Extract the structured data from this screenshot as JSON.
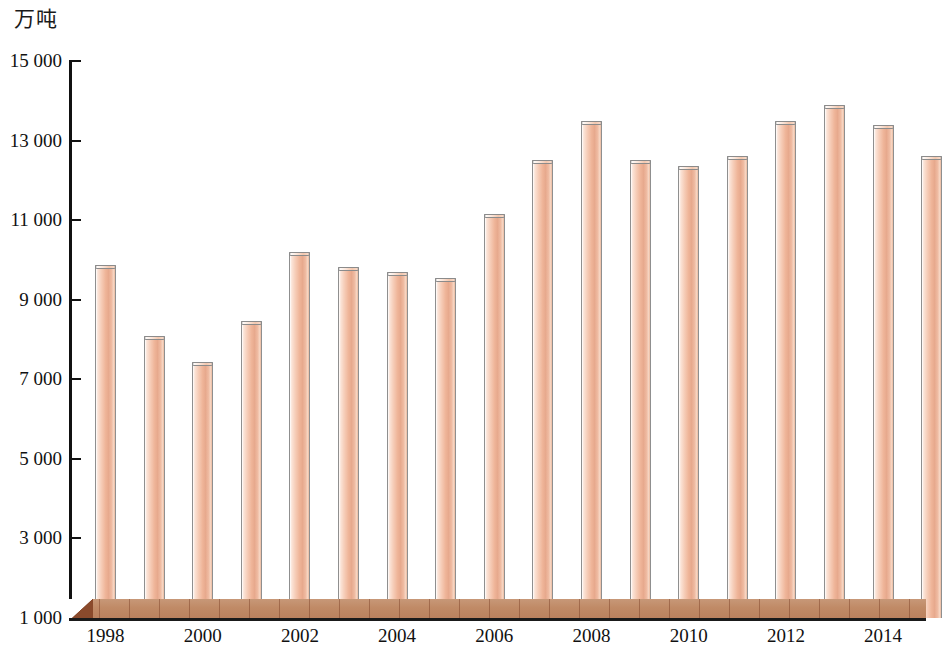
{
  "unit_label": "万吨",
  "chart_data": {
    "type": "bar",
    "title": "",
    "subtitle": "",
    "xlabel": "",
    "ylabel": "万吨",
    "ylim": [
      1000,
      15000
    ],
    "ytick_step": 2000,
    "grid": false,
    "legend": null,
    "categories": [
      "1998",
      "1999",
      "2000",
      "2001",
      "2002",
      "2003",
      "2004",
      "2005",
      "2006",
      "2007",
      "2008",
      "2009",
      "2010",
      "2011",
      "2012",
      "2013",
      "2014",
      "2015"
    ],
    "values": [
      9870,
      8100,
      7430,
      8460,
      10200,
      9830,
      9700,
      9550,
      11150,
      12500,
      13500,
      12500,
      12350,
      12600,
      13500,
      13900,
      13400,
      12600
    ],
    "y_tick_labels": [
      "15 000",
      "13 000",
      "11 000",
      "9 000",
      "7 000",
      "5 000",
      "3 000",
      "1 000"
    ],
    "y_tick_values": [
      15000,
      13000,
      11000,
      9000,
      7000,
      5000,
      3000,
      1000
    ],
    "x_tick_labels": [
      "1998",
      "2000",
      "2002",
      "2004",
      "2006",
      "2008",
      "2010",
      "2012",
      "2014"
    ],
    "x_tick_categories": [
      "1998",
      "2000",
      "2002",
      "2004",
      "2006",
      "2008",
      "2010",
      "2012",
      "2014"
    ],
    "colors": {
      "bar_fill_light": "#fbe4d8",
      "bar_fill_mid": "#f3c7ae",
      "bar_fill_dark": "#e7a98d",
      "bar_outline": "#8f8f8f",
      "axis": "#111111",
      "base_platform": "#c08a66",
      "base_platform_shadow": "#8a4a2c",
      "background": "#ffffff",
      "text": "#111111"
    }
  }
}
